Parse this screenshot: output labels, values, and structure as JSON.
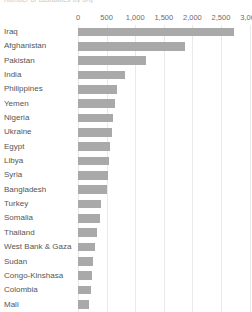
{
  "chart_data": {
    "type": "bar",
    "orientation": "horizontal",
    "title": "number of casualties by org",
    "title_truncated": true,
    "xlabel": "",
    "ylabel": "",
    "xlim": [
      0,
      3000
    ],
    "grid": true,
    "legend": "none",
    "axis_position": "top",
    "tick_labels": [
      "0",
      "500",
      "1,000",
      "1,500",
      "2,000",
      "2,500",
      "3,000"
    ],
    "tick_values": [
      0,
      500,
      1000,
      1500,
      2000,
      2500,
      3000
    ],
    "last_tick_clipped": true,
    "bar_color": "#a9a9a9",
    "gridline_color": "#e9e9e9",
    "text_color": "#555555",
    "categories": [
      "Iraq",
      "Afghanistan",
      "Pakistan",
      "India",
      "Philippines",
      "Yemen",
      "Nigeria",
      "Ukraine",
      "Egypt",
      "Libya",
      "Syria",
      "Bangladesh",
      "Turkey",
      "Somalia",
      "Thailand",
      "West Bank & Gaza",
      "Sudan",
      "Congo-Kinshasa",
      "Colombia",
      "Mali"
    ],
    "values": [
      2730,
      1870,
      1190,
      820,
      680,
      650,
      620,
      600,
      560,
      540,
      520,
      500,
      400,
      385,
      330,
      290,
      270,
      250,
      230,
      200
    ]
  }
}
